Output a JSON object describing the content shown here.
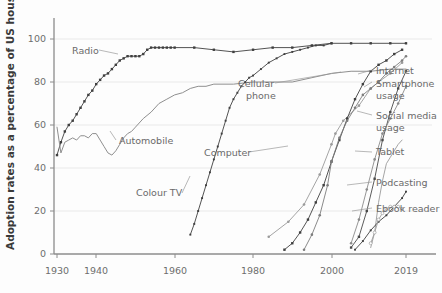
{
  "chart_data": {
    "type": "line",
    "title": "",
    "xlabel": "",
    "ylabel": "Adoption rates as a percentage of US households",
    "xlim": [
      1930,
      2019
    ],
    "ylim": [
      0,
      105
    ],
    "xticks": [
      1930,
      1940,
      1960,
      1980,
      2000,
      2019
    ],
    "xtick_labels": [
      "1930",
      "1940",
      "1960",
      "1980",
      "2000",
      "2019"
    ],
    "yticks": [
      0,
      20,
      40,
      60,
      80,
      100
    ],
    "ytick_labels": [
      "0",
      "20",
      "40",
      "60",
      "80",
      "100"
    ],
    "grid": true,
    "legend_position": "inline-annotations",
    "series": [
      {
        "name": "Radio",
        "label": "Radio",
        "color": "#3f3f3f",
        "marker": "square",
        "x": [
          1930,
          1931,
          1932,
          1933,
          1934,
          1935,
          1936,
          1937,
          1938,
          1939,
          1940,
          1941,
          1942,
          1943,
          1944,
          1945,
          1946,
          1947,
          1948,
          1949,
          1950,
          1951,
          1952,
          1953,
          1954,
          1955,
          1956,
          1957,
          1958,
          1959,
          1960,
          1965,
          1970,
          1975,
          1980,
          1985,
          1990,
          1995,
          2000,
          2005,
          2010,
          2015,
          2019
        ],
        "y": [
          46,
          52,
          57,
          60,
          62,
          65,
          68,
          71,
          74,
          76,
          79,
          81,
          83,
          84,
          86,
          88,
          90,
          91,
          92,
          92,
          92,
          92,
          93,
          95,
          96,
          96,
          96,
          96,
          96,
          96,
          96,
          96,
          95,
          94,
          95,
          96,
          96,
          97,
          98,
          98,
          98,
          98,
          98
        ]
      },
      {
        "name": "Automobile",
        "label": "Automobile",
        "color": "#8f8f8f",
        "marker": "none",
        "x": [
          1930,
          1931,
          1932,
          1933,
          1934,
          1935,
          1936,
          1937,
          1938,
          1939,
          1940,
          1941,
          1942,
          1943,
          1944,
          1945,
          1946,
          1947,
          1948,
          1949,
          1950,
          1952,
          1954,
          1956,
          1958,
          1960,
          1962,
          1964,
          1966,
          1968,
          1970,
          1975,
          1980,
          1985,
          1990,
          1995,
          2000,
          2005,
          2010,
          2015,
          2019
        ],
        "y": [
          59,
          47,
          52,
          53,
          54,
          53,
          55,
          55,
          54,
          56,
          56,
          53,
          50,
          47,
          46,
          48,
          51,
          54,
          56,
          57,
          59,
          63,
          66,
          70,
          72,
          74,
          75,
          77,
          78,
          78,
          79,
          79,
          80,
          80,
          80,
          82,
          84,
          85,
          85,
          86,
          86
        ]
      },
      {
        "name": "Colour TV",
        "label": "Colour TV",
        "color": "#3f3f3f",
        "marker": "small-square",
        "x": [
          1964,
          1965,
          1966,
          1967,
          1968,
          1969,
          1970,
          1971,
          1972,
          1973,
          1974,
          1975,
          1976,
          1977,
          1978,
          1979,
          1980,
          1982,
          1984,
          1986,
          1988,
          1990,
          1992,
          1994,
          1996,
          1998,
          2000
        ],
        "y": [
          9,
          14,
          20,
          26,
          32,
          38,
          44,
          50,
          56,
          62,
          68,
          72,
          75,
          78,
          80,
          82,
          83,
          86,
          89,
          91,
          93,
          94,
          95,
          96,
          97,
          97,
          98
        ]
      },
      {
        "name": "Computer",
        "label": "Computer",
        "color": "#9a9a9a",
        "marker": "circle",
        "x": [
          1984,
          1989,
          1993,
          1997,
          2000,
          2001,
          2003,
          2007,
          2010,
          2012,
          2015,
          2018
        ],
        "y": [
          8,
          15,
          23,
          37,
          51,
          56,
          62,
          69,
          77,
          80,
          84,
          89
        ]
      },
      {
        "name": "Cellular phone",
        "label": "Cellular phone",
        "color": "#3f3f3f",
        "marker": "square",
        "x": [
          1988,
          1990,
          1992,
          1994,
          1996,
          1998,
          2000,
          2002,
          2004,
          2006,
          2008,
          2010,
          2012,
          2014,
          2016,
          2018
        ],
        "y": [
          2,
          5,
          10,
          16,
          24,
          32,
          43,
          53,
          63,
          72,
          79,
          85,
          88,
          90,
          93,
          95
        ]
      },
      {
        "name": "Internet",
        "label": "Internet",
        "color": "#7d7d7d",
        "marker": "circle",
        "x": [
          1993,
          1995,
          1997,
          1999,
          2000,
          2002,
          2004,
          2006,
          2008,
          2010,
          2012,
          2014,
          2016,
          2018,
          2019
        ],
        "y": [
          2,
          9,
          18,
          32,
          43,
          54,
          62,
          68,
          74,
          77,
          80,
          84,
          87,
          90,
          92
        ]
      },
      {
        "name": "Smartphone usage",
        "label": "Smartphone usage",
        "color": "#4a4a4a",
        "marker": "square",
        "x": [
          2005,
          2007,
          2009,
          2011,
          2013,
          2015,
          2017,
          2019
        ],
        "y": [
          3,
          8,
          20,
          35,
          53,
          66,
          77,
          85
        ]
      },
      {
        "name": "Social media usage",
        "label": "Social media usage",
        "color": "#8a8a8a",
        "marker": "circle",
        "x": [
          2005,
          2007,
          2009,
          2011,
          2013,
          2015,
          2017,
          2019
        ],
        "y": [
          5,
          16,
          30,
          44,
          56,
          63,
          70,
          78
        ]
      },
      {
        "name": "Tablet",
        "label": "Tablet",
        "color": "#a5a5a5",
        "marker": "none",
        "x": [
          2010,
          2011,
          2012,
          2013,
          2014,
          2015,
          2016,
          2017,
          2018
        ],
        "y": [
          3,
          10,
          24,
          34,
          42,
          45,
          48,
          51,
          53
        ]
      },
      {
        "name": "Podcasting",
        "label": "Podcasting",
        "color": "#3f3f3f",
        "marker": "small-square",
        "x": [
          2006,
          2008,
          2010,
          2012,
          2014,
          2016,
          2018,
          2019
        ],
        "y": [
          2,
          6,
          11,
          15,
          18,
          22,
          26,
          29
        ]
      },
      {
        "name": "Ebook reader",
        "label": "Ebook reader",
        "color": "#9e9e9e",
        "marker": "open-circle",
        "x": [
          2010,
          2011,
          2012,
          2013,
          2014,
          2015,
          2016,
          2017,
          2018
        ],
        "y": [
          5,
          10,
          16,
          19,
          21,
          22,
          22,
          22,
          21
        ]
      }
    ],
    "inline_annotations": [
      {
        "name": "radio",
        "text": "Radio"
      },
      {
        "name": "automobile",
        "text": "Automobile"
      },
      {
        "name": "colour-tv",
        "text": "Colour TV"
      },
      {
        "name": "computer",
        "text": "Computer"
      },
      {
        "name": "cellular-phone-line1",
        "text": "Cellular"
      },
      {
        "name": "cellular-phone-line2",
        "text": "phone"
      }
    ],
    "right_callouts": [
      {
        "name": "internet",
        "text": "Internet"
      },
      {
        "name": "smartphone-line1",
        "text": "Smartphone"
      },
      {
        "name": "smartphone-line2",
        "text": "usage"
      },
      {
        "name": "social-media-line1",
        "text": "Social media"
      },
      {
        "name": "social-media-line2",
        "text": "usage"
      },
      {
        "name": "tablet",
        "text": "Tablet"
      },
      {
        "name": "podcasting",
        "text": "Podcasting"
      },
      {
        "name": "ebook-reader",
        "text": "Ebook reader"
      }
    ],
    "colors": {
      "background": "#fdfdfd",
      "grid": "#e9e9e9",
      "axis": "#8c8c8c",
      "text": "#6a6a6a",
      "axis_title": "#3a3a3a"
    }
  }
}
